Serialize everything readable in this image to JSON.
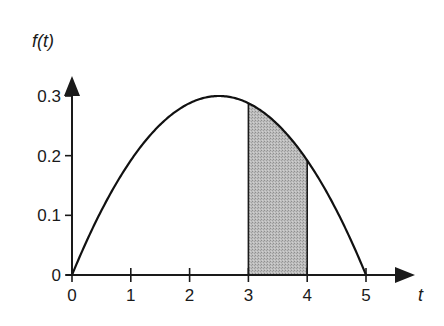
{
  "chart_data": {
    "type": "line",
    "title": "",
    "xlabel": "t",
    "ylabel": "f(t)",
    "xlim": [
      0,
      5
    ],
    "ylim": [
      0,
      0.3
    ],
    "grid": false,
    "x_ticks": [
      0,
      1,
      2,
      3,
      4,
      5
    ],
    "x_tick_labels": [
      "0",
      "1",
      "2",
      "3",
      "4",
      "5"
    ],
    "y_ticks": [
      0,
      0.1,
      0.2,
      0.3
    ],
    "y_tick_labels": [
      "0",
      "0.1",
      "0.2",
      "0.3"
    ],
    "series": [
      {
        "name": "f(t)",
        "description": "parabola f(t) = 0.048 t (5 - t), peak 0.3 at t = 2.5",
        "x": [
          0,
          0.5,
          1,
          1.5,
          2,
          2.5,
          3,
          3.5,
          4,
          4.5,
          5
        ],
        "values": [
          0,
          0.108,
          0.192,
          0.252,
          0.288,
          0.3,
          0.288,
          0.252,
          0.192,
          0.108,
          0
        ]
      }
    ],
    "shaded_region": {
      "from": 3,
      "to": 4,
      "fill": "#b3b3b3",
      "description": "area under f(t) between t=3 and t=4"
    },
    "colors": {
      "curve": "#111111",
      "axes": "#1a1a1a",
      "shade": "#b3b3b3"
    }
  }
}
